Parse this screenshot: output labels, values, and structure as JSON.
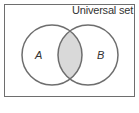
{
  "diagram": {
    "type": "venn",
    "universal_label": "Universal set",
    "sets": [
      {
        "label": "A",
        "cx": 52,
        "cy": 55,
        "r": 30
      },
      {
        "label": "B",
        "cx": 88,
        "cy": 55,
        "r": 30
      }
    ],
    "highlight": "A ∩ B",
    "colors": {
      "stroke": "#6e6e6e",
      "intersection_fill": "#d9d9d9",
      "background": "#ffffff"
    }
  }
}
